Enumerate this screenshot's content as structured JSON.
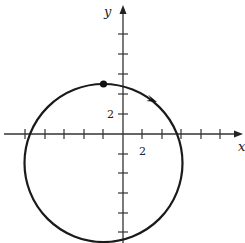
{
  "figure": {
    "type": "circle-on-axes",
    "axes": {
      "x_label": "x",
      "y_label": "y",
      "tick_step_units": 2,
      "x_tick_label": "2",
      "y_tick_label": "2",
      "x_ticks": [
        -10,
        -8,
        -6,
        -4,
        -2,
        2,
        4,
        6,
        8,
        10
      ],
      "y_ticks": [
        -10,
        -8,
        -6,
        -4,
        -2,
        2,
        4,
        6,
        8
      ]
    },
    "circle": {
      "center": [
        -2,
        -3
      ],
      "radius": 8,
      "direction": "clockwise"
    },
    "start_point": [
      -2,
      5
    ],
    "colors": {
      "stroke": "#222222",
      "background": "#ffffff"
    }
  }
}
